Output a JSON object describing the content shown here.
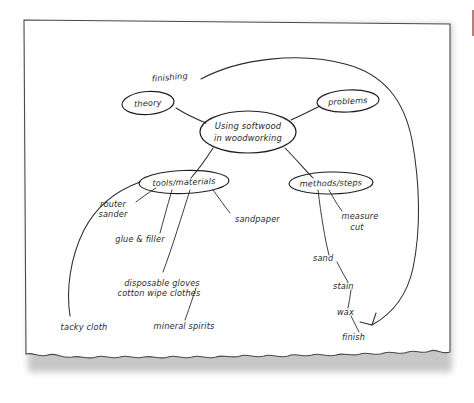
{
  "document": {
    "kind": "hand-drawn-mind-map",
    "paper_color": "#ffffff",
    "ink_color": "#2b2b2b",
    "accent_color": "#a86a63"
  },
  "mindmap": {
    "center": {
      "id": "center",
      "line1": "Using softwood",
      "line2": "in woodworking",
      "shape": "ellipse"
    },
    "nodes": [
      {
        "id": "theory",
        "label": "theory",
        "shape": "ellipse"
      },
      {
        "id": "problems",
        "label": "problems",
        "shape": "ellipse"
      },
      {
        "id": "tools",
        "label": "tools/materials",
        "shape": "ellipse"
      },
      {
        "id": "methods",
        "label": "methods/steps",
        "shape": "ellipse"
      }
    ],
    "free_labels": [
      {
        "id": "finishing",
        "label": "finishing"
      },
      {
        "id": "router",
        "label": "router"
      },
      {
        "id": "sander",
        "label": "sander"
      },
      {
        "id": "glue-filler",
        "label": "glue & filler"
      },
      {
        "id": "sandpaper",
        "label": "sandpaper"
      },
      {
        "id": "disposable-gloves",
        "label": "disposable gloves"
      },
      {
        "id": "cotton-wipe-clothes",
        "label": "cotton wipe clothes"
      },
      {
        "id": "mineral-spirits",
        "label": "mineral spirits"
      },
      {
        "id": "tacky-cloth",
        "label": "tacky cloth"
      },
      {
        "id": "measure",
        "label": "measure"
      },
      {
        "id": "cut",
        "label": "cut"
      },
      {
        "id": "sand",
        "label": "sand"
      },
      {
        "id": "stain",
        "label": "stain"
      },
      {
        "id": "wax",
        "label": "wax"
      },
      {
        "id": "finish",
        "label": "finish"
      }
    ]
  }
}
